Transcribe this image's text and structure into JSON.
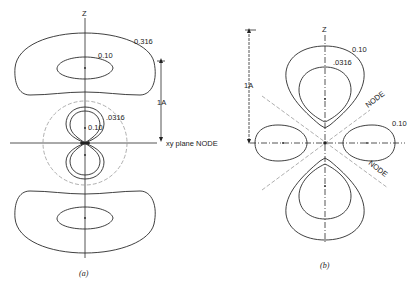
{
  "figure_a": {
    "caption": "(a)",
    "axis_label": "Z",
    "outer_contour_label": "0.316",
    "inner_contour_label": "0.10",
    "small_lobe_outer_label": ".0316",
    "small_lobe_inner_label": "0.10",
    "scale_label": "1A",
    "node_label": "xy plane NODE"
  },
  "figure_b": {
    "caption": "(b)",
    "axis_label": "Z",
    "outer_contour_label": "0.10",
    "inner_contour_label": ".0316",
    "side_lobe_label": "0.10",
    "scale_label": "1A",
    "node_upper_label": "NODE",
    "node_lower_label": "NODE"
  }
}
